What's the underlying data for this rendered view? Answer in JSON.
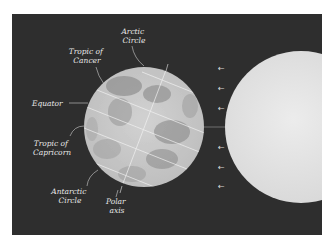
{
  "figure": {
    "type": "earth-sun-seasons-diagram",
    "colors": {
      "background": "#2e2e2e",
      "earth": "#c9c9c9",
      "earth_shadow": "#8a8a8a",
      "sun": "#e4e4e4",
      "lines": "#f2f2f2",
      "label": "#e8e8e8"
    },
    "labels": {
      "arctic_circle": [
        "Arctic",
        "Circle"
      ],
      "tropic_of_cancer": [
        "Tropic of",
        "Cancer"
      ],
      "equator": [
        "Equator"
      ],
      "tropic_of_capricorn": [
        "Tropic of",
        "Capricorn"
      ],
      "antarctic_circle": [
        "Antarctic",
        "Circle"
      ],
      "polar_axis": [
        "Polar",
        "axis"
      ]
    },
    "sunlight_arrows": {
      "count": 6,
      "direction": "left",
      "glyph": "←"
    },
    "earth_axial_tilt_degrees": 23.5
  }
}
